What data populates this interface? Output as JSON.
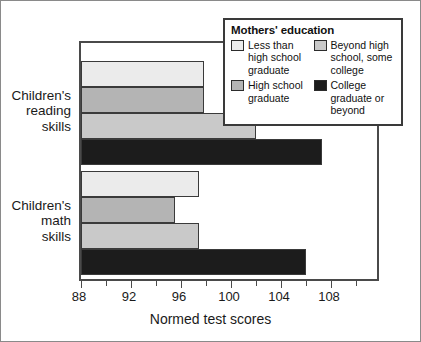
{
  "chart_data": {
    "type": "bar",
    "orientation": "horizontal",
    "title": "",
    "xlabel": "Normed test scores",
    "ylabel": "",
    "xlim": [
      88,
      112
    ],
    "grid": false,
    "xticks": [
      88,
      92,
      96,
      100,
      104,
      108
    ],
    "xtick_labels": [
      "88",
      "92",
      "96",
      "100",
      "104",
      "108"
    ],
    "minor_tick_step": 2,
    "categories": [
      "Children's reading skills",
      "Children's math skills"
    ],
    "legend_position": "top-right",
    "series": [
      {
        "name": "Less than high school graduate",
        "color": "#ebebeb",
        "values": [
          97.8,
          97.4
        ]
      },
      {
        "name": "High school graduate",
        "color": "#b4b4b4",
        "values": [
          97.8,
          95.5
        ]
      },
      {
        "name": "Beyond high school, some college",
        "color": "#c9c9c9",
        "values": [
          102.0,
          97.4
        ]
      },
      {
        "name": "College graduate or beyond",
        "color": "#1c1c1c",
        "values": [
          107.3,
          106.0
        ]
      }
    ]
  },
  "axis": {
    "x_title": "Normed test scores",
    "tick_labels": [
      "88",
      "92",
      "96",
      "100",
      "104",
      "108"
    ]
  },
  "categories": [
    {
      "lines": [
        "Children's",
        "reading",
        "skills"
      ]
    },
    {
      "lines": [
        "Children's",
        "math",
        "skills"
      ]
    }
  ],
  "legend": {
    "title": "Mothers' education",
    "entries": [
      {
        "label": "Less than high school graduate",
        "color": "#ebebeb",
        "column": 0
      },
      {
        "label": "High school graduate",
        "color": "#b4b4b4",
        "column": 0
      },
      {
        "label": "Beyond high school, some college",
        "color": "#c9c9c9",
        "column": 1
      },
      {
        "label": "College graduate or beyond",
        "color": "#1c1c1c",
        "column": 1
      }
    ]
  }
}
